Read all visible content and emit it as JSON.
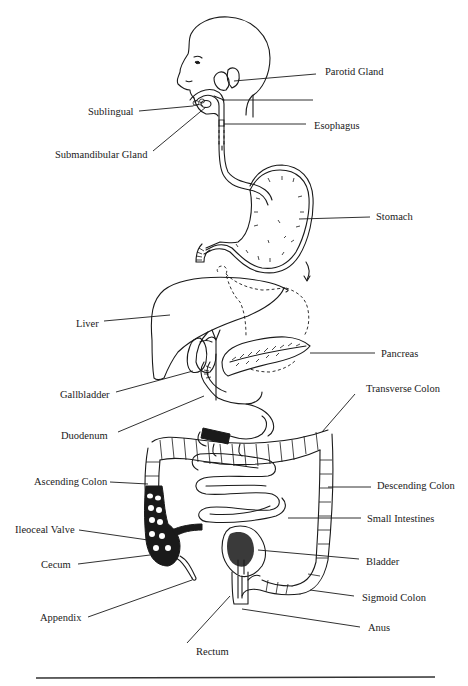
{
  "diagram": {
    "labels": [
      {
        "id": "parotid-gland",
        "text": "Parotid Gland",
        "x": 325,
        "y": 66
      },
      {
        "id": "sublingual",
        "text": "Sublingual",
        "x": 88,
        "y": 108
      },
      {
        "id": "esophagus",
        "text": "Esophagus",
        "x": 314,
        "y": 121
      },
      {
        "id": "submandibular-gland",
        "text": "Submandibular Gland",
        "x": 55,
        "y": 149
      },
      {
        "id": "stomach",
        "text": "Stomach",
        "x": 376,
        "y": 210
      },
      {
        "id": "liver",
        "text": "Liver",
        "x": 76,
        "y": 318
      },
      {
        "id": "pancreas",
        "text": "Pancreas",
        "x": 381,
        "y": 349
      },
      {
        "id": "transverse-colon",
        "text": "Transverse Colon",
        "x": 366,
        "y": 384
      },
      {
        "id": "gallbladder",
        "text": "Gallbladder",
        "x": 60,
        "y": 389
      },
      {
        "id": "duodenum",
        "text": "Duodenum",
        "x": 61,
        "y": 430
      },
      {
        "id": "ascending-colon",
        "text": "Ascending Colon",
        "x": 34,
        "y": 476
      },
      {
        "id": "descending-colon",
        "text": "Descending Colon",
        "x": 377,
        "y": 480
      },
      {
        "id": "small-intestines",
        "text": "Small Intestines",
        "x": 367,
        "y": 514
      },
      {
        "id": "ileocecal-valve",
        "text": "Ileoceal Valve",
        "x": 15,
        "y": 524
      },
      {
        "id": "cecum",
        "text": "Cecum",
        "x": 41,
        "y": 558
      },
      {
        "id": "bladder",
        "text": "Bladder",
        "x": 366,
        "y": 555
      },
      {
        "id": "sigmoid-colon",
        "text": "Sigmoid Colon",
        "x": 362,
        "y": 591
      },
      {
        "id": "appendix",
        "text": "Appendix",
        "x": 40,
        "y": 611
      },
      {
        "id": "anus",
        "text": "Anus",
        "x": 368,
        "y": 621
      },
      {
        "id": "rectum",
        "text": "Rectum",
        "x": 196,
        "y": 645
      }
    ],
    "unlabeled_pointer": {
      "note": "blank label line pointing to pharynx",
      "x1": 222,
      "y1": 100,
      "x2": 313,
      "y2": 100
    }
  },
  "colors": {
    "ink": "#1a1a1a",
    "background": "#ffffff"
  }
}
